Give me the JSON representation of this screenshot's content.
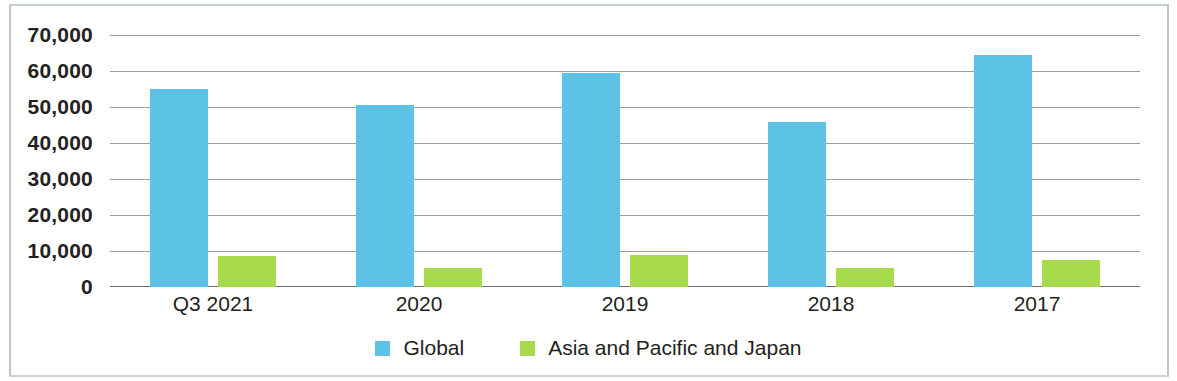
{
  "chart_data": {
    "type": "bar",
    "title": "",
    "xlabel": "",
    "ylabel": "",
    "categories": [
      "Q3 2021",
      "2020",
      "2019",
      "2018",
      "2017"
    ],
    "ylim": [
      0,
      70000
    ],
    "yticks": [
      70000,
      60000,
      50000,
      40000,
      30000,
      20000,
      10000,
      0
    ],
    "ytick_labels": [
      "70,000",
      "60,000",
      "50,000",
      "40,000",
      "30,000",
      "20,000",
      "10,000",
      "0"
    ],
    "grid": true,
    "legend_position": "bottom-center",
    "series": [
      {
        "name": "Global",
        "color": "#5cc3e6",
        "values": [
          55000,
          50500,
          59500,
          45700,
          64400
        ]
      },
      {
        "name": "Asia and Pacific and Japan",
        "color": "#a7db4b",
        "values": [
          8700,
          5400,
          8900,
          5400,
          7500
        ]
      }
    ]
  },
  "legend": {
    "items": [
      {
        "label": "Global",
        "swatch": "legend-swatch-blue"
      },
      {
        "label": "Asia and Pacific and Japan",
        "swatch": "legend-swatch-green"
      }
    ]
  }
}
